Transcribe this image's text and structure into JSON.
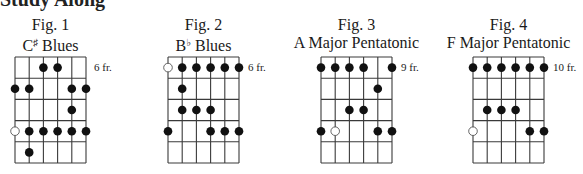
{
  "heading": "Study Along",
  "figures": [
    {
      "title": "Fig. 1",
      "root": "C",
      "accidental": "♯",
      "scale": "Blues",
      "fret_label": "6 fr.",
      "fret_label_row": 0,
      "grid_x": 15,
      "dots": [
        {
          "string": 2,
          "fret": 0,
          "open": false
        },
        {
          "string": 3,
          "fret": 0,
          "open": false
        },
        {
          "string": 0,
          "fret": 1,
          "open": false
        },
        {
          "string": 1,
          "fret": 1,
          "open": false
        },
        {
          "string": 4,
          "fret": 1,
          "open": false
        },
        {
          "string": 5,
          "fret": 1,
          "open": false
        },
        {
          "string": 4,
          "fret": 2,
          "open": false
        },
        {
          "string": 0,
          "fret": 3,
          "open": true
        },
        {
          "string": 1,
          "fret": 3,
          "open": false
        },
        {
          "string": 2,
          "fret": 3,
          "open": false
        },
        {
          "string": 3,
          "fret": 3,
          "open": false
        },
        {
          "string": 4,
          "fret": 3,
          "open": false
        },
        {
          "string": 5,
          "fret": 3,
          "open": false
        },
        {
          "string": 1,
          "fret": 4,
          "open": false
        }
      ]
    },
    {
      "title": "Fig. 2",
      "root": "B",
      "accidental": "♭",
      "scale": "Blues",
      "fret_label": "6 fr.",
      "fret_label_row": 0,
      "grid_x": 168,
      "dots": [
        {
          "string": 0,
          "fret": 0,
          "open": true
        },
        {
          "string": 1,
          "fret": 0,
          "open": false
        },
        {
          "string": 2,
          "fret": 0,
          "open": false
        },
        {
          "string": 3,
          "fret": 0,
          "open": false
        },
        {
          "string": 4,
          "fret": 0,
          "open": false
        },
        {
          "string": 5,
          "fret": 0,
          "open": false
        },
        {
          "string": 1,
          "fret": 1,
          "open": false
        },
        {
          "string": 1,
          "fret": 2,
          "open": false
        },
        {
          "string": 2,
          "fret": 2,
          "open": false
        },
        {
          "string": 3,
          "fret": 2,
          "open": false
        },
        {
          "string": 0,
          "fret": 3,
          "open": false
        },
        {
          "string": 3,
          "fret": 3,
          "open": false
        },
        {
          "string": 4,
          "fret": 3,
          "open": false
        },
        {
          "string": 5,
          "fret": 3,
          "open": false
        }
      ]
    },
    {
      "title": "Fig. 3",
      "root": "A",
      "accidental": "",
      "scale": "Major Pentatonic",
      "fret_label": "9 fr.",
      "fret_label_row": 0,
      "grid_x": 321,
      "dots": [
        {
          "string": 0,
          "fret": 0,
          "open": false
        },
        {
          "string": 1,
          "fret": 0,
          "open": false
        },
        {
          "string": 2,
          "fret": 0,
          "open": false
        },
        {
          "string": 3,
          "fret": 0,
          "open": false
        },
        {
          "string": 5,
          "fret": 0,
          "open": false
        },
        {
          "string": 4,
          "fret": 1,
          "open": false
        },
        {
          "string": 2,
          "fret": 2,
          "open": false
        },
        {
          "string": 3,
          "fret": 2,
          "open": false
        },
        {
          "string": 0,
          "fret": 3,
          "open": false
        },
        {
          "string": 1,
          "fret": 3,
          "open": true
        },
        {
          "string": 4,
          "fret": 3,
          "open": false
        },
        {
          "string": 5,
          "fret": 3,
          "open": false
        }
      ]
    },
    {
      "title": "Fig. 4",
      "root": "F",
      "accidental": "",
      "scale": "Major Pentatonic",
      "fret_label": "10 fr.",
      "fret_label_row": 0,
      "grid_x": 473,
      "dots": [
        {
          "string": 0,
          "fret": 0,
          "open": false
        },
        {
          "string": 1,
          "fret": 0,
          "open": false
        },
        {
          "string": 2,
          "fret": 0,
          "open": false
        },
        {
          "string": 3,
          "fret": 0,
          "open": false
        },
        {
          "string": 4,
          "fret": 0,
          "open": false
        },
        {
          "string": 5,
          "fret": 0,
          "open": false
        },
        {
          "string": 1,
          "fret": 2,
          "open": false
        },
        {
          "string": 2,
          "fret": 2,
          "open": false
        },
        {
          "string": 3,
          "fret": 2,
          "open": false
        },
        {
          "string": 0,
          "fret": 3,
          "open": true
        },
        {
          "string": 4,
          "fret": 3,
          "open": false
        },
        {
          "string": 5,
          "fret": 3,
          "open": false
        }
      ]
    }
  ],
  "grid": {
    "strings": 6,
    "frets": 5,
    "top": 57,
    "width": 71,
    "height": 106,
    "line_color": "#3a3a3a",
    "dot_color": "#111111",
    "dot_radius": 4.3
  }
}
